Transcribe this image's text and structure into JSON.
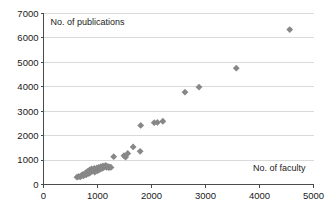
{
  "chart_data": {
    "type": "scatter",
    "title": "",
    "xlabel": "No. of faculty",
    "ylabel": "No. of publications",
    "xlim": [
      0,
      5000
    ],
    "ylim": [
      0,
      7000
    ],
    "xticks": [
      0,
      1000,
      2000,
      3000,
      4000,
      5000
    ],
    "yticks": [
      0,
      1000,
      2000,
      3000,
      4000,
      5000,
      6000,
      7000
    ],
    "xtick_labels": [
      "0",
      "1000",
      "2000",
      "3000",
      "4000",
      "5000"
    ],
    "ytick_labels": [
      "0",
      "1000",
      "2000",
      "3000",
      "4000",
      "5000",
      "6000",
      "7000"
    ],
    "grid": "horizontal",
    "legend": "none",
    "marker": "diamond",
    "marker_color": "#878787",
    "points": [
      {
        "x": 620,
        "y": 300
      },
      {
        "x": 650,
        "y": 330
      },
      {
        "x": 680,
        "y": 310
      },
      {
        "x": 700,
        "y": 360
      },
      {
        "x": 720,
        "y": 400
      },
      {
        "x": 740,
        "y": 350
      },
      {
        "x": 760,
        "y": 430
      },
      {
        "x": 780,
        "y": 470
      },
      {
        "x": 790,
        "y": 390
      },
      {
        "x": 810,
        "y": 520
      },
      {
        "x": 830,
        "y": 560
      },
      {
        "x": 840,
        "y": 450
      },
      {
        "x": 860,
        "y": 600
      },
      {
        "x": 870,
        "y": 500
      },
      {
        "x": 890,
        "y": 640
      },
      {
        "x": 900,
        "y": 540
      },
      {
        "x": 920,
        "y": 590
      },
      {
        "x": 940,
        "y": 660
      },
      {
        "x": 950,
        "y": 510
      },
      {
        "x": 970,
        "y": 620
      },
      {
        "x": 990,
        "y": 680
      },
      {
        "x": 1000,
        "y": 560
      },
      {
        "x": 1020,
        "y": 700
      },
      {
        "x": 1040,
        "y": 610
      },
      {
        "x": 1060,
        "y": 730
      },
      {
        "x": 1080,
        "y": 650
      },
      {
        "x": 1100,
        "y": 760
      },
      {
        "x": 1110,
        "y": 690
      },
      {
        "x": 1130,
        "y": 720
      },
      {
        "x": 1150,
        "y": 780
      },
      {
        "x": 1170,
        "y": 700
      },
      {
        "x": 1190,
        "y": 740
      },
      {
        "x": 1210,
        "y": 690
      },
      {
        "x": 1230,
        "y": 720
      },
      {
        "x": 1250,
        "y": 700
      },
      {
        "x": 1300,
        "y": 1140
      },
      {
        "x": 1490,
        "y": 1180
      },
      {
        "x": 1520,
        "y": 1120
      },
      {
        "x": 1560,
        "y": 1270
      },
      {
        "x": 1660,
        "y": 1540
      },
      {
        "x": 1790,
        "y": 1360
      },
      {
        "x": 1800,
        "y": 2420
      },
      {
        "x": 2050,
        "y": 2530
      },
      {
        "x": 2110,
        "y": 2540
      },
      {
        "x": 2210,
        "y": 2590
      },
      {
        "x": 2620,
        "y": 3780
      },
      {
        "x": 2880,
        "y": 3990
      },
      {
        "x": 3570,
        "y": 4760
      },
      {
        "x": 4560,
        "y": 6340
      }
    ]
  },
  "axes": {
    "y_title": "No. of publications",
    "x_title": "No. of faculty"
  }
}
